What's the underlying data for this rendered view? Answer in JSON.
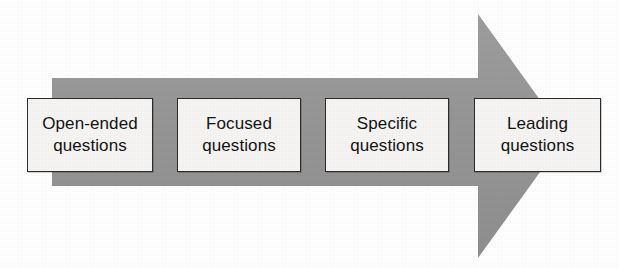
{
  "diagram": {
    "type": "process-arrow-flow",
    "direction": "left-to-right",
    "title": "",
    "colors": {
      "arrow_fill": "#979797",
      "box_fill": "#f6f5f3",
      "box_border": "#2b2b2b",
      "text": "#141414",
      "background": "#ffffff"
    },
    "arrow": {
      "name": "funnel-arrow",
      "body": {
        "x": 52,
        "y": 78,
        "width": 426,
        "height": 108
      },
      "head": {
        "base_x": 478,
        "top_y": 14,
        "bottom_y": 258,
        "tip_x": 566,
        "tip_y": 136
      }
    },
    "stages": [
      {
        "id": "open-ended",
        "line1": "Open-ended",
        "line2": "questions",
        "x": 27,
        "y": 98,
        "width": 126,
        "height": 74
      },
      {
        "id": "focused",
        "line1": "Focused",
        "line2": "questions",
        "x": 177,
        "y": 98,
        "width": 124,
        "height": 74
      },
      {
        "id": "specific",
        "line1": "Specific",
        "line2": "questions",
        "x": 325,
        "y": 98,
        "width": 124,
        "height": 74
      },
      {
        "id": "leading",
        "line1": "Leading",
        "line2": "questions",
        "x": 474,
        "y": 98,
        "width": 127,
        "height": 74
      }
    ]
  }
}
